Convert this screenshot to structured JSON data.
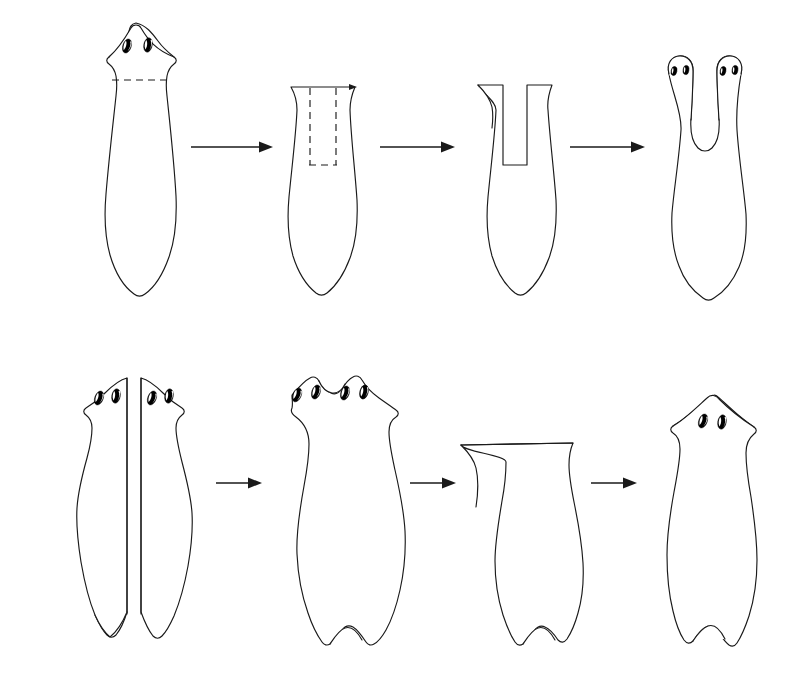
{
  "figure": {
    "background_color": "#ffffff",
    "ink_color": "#1a1a1a",
    "eyespot_color": "#000000",
    "width": 805,
    "height": 680
  },
  "rows": [
    {
      "id": "row-top",
      "name": "head-splitting-series",
      "caption": "Longitudinal head split produces a two-headed planarian",
      "steps": [
        {
          "index": 1,
          "name": "intact-planarian",
          "label": "Intact planarian",
          "eyespot_count": 2,
          "head_lobes": 1,
          "tail_lobes": 1,
          "marking": "dashed transverse decapitation line"
        },
        {
          "index": 2,
          "name": "decapitated-body-with-cut-plan",
          "label": "Head removed, median cut planned",
          "eyespot_count": 0,
          "head_lobes": 0,
          "tail_lobes": 1,
          "marking": "dashed U-shaped median incision"
        },
        {
          "index": 3,
          "name": "body-with-median-slit",
          "label": "Median slit made",
          "eyespot_count": 0,
          "head_lobes": 2,
          "tail_lobes": 1,
          "marking": "open rectangular notch"
        },
        {
          "index": 4,
          "name": "two-headed-regenerate",
          "label": "Two-headed regenerate",
          "eyespot_count": 4,
          "head_lobes": 2,
          "tail_lobes": 1,
          "marking": "none"
        }
      ],
      "arrows": 3
    },
    {
      "id": "row-bottom",
      "name": "half-fusion-series",
      "caption": "Two longitudinal halves fused, then decapitated and regenerated",
      "steps": [
        {
          "index": 1,
          "name": "two-longitudinal-halves",
          "label": "Two longitudinal halves apposed",
          "eyespot_count": 4,
          "head_lobes": 2,
          "tail_lobes": 2,
          "marking": "two separate half-worms"
        },
        {
          "index": 2,
          "name": "fused-double-worm",
          "label": "Fused double worm",
          "eyespot_count": 4,
          "head_lobes": 2,
          "tail_lobes": 2,
          "marking": "none"
        },
        {
          "index": 3,
          "name": "decapitated-fused-body",
          "label": "Fused body decapitated",
          "eyespot_count": 0,
          "head_lobes": 0,
          "tail_lobes": 2,
          "marking": "flat anterior cut surface"
        },
        {
          "index": 4,
          "name": "single-head-regenerate",
          "label": "Single head regenerated",
          "eyespot_count": 2,
          "head_lobes": 1,
          "tail_lobes": 2,
          "marking": "none"
        }
      ],
      "arrows": 3
    }
  ]
}
